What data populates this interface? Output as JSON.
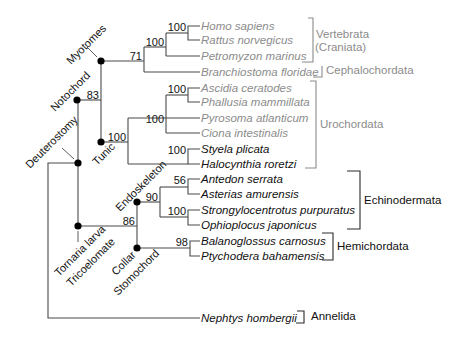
{
  "diagram": {
    "type": "phylogenetic-tree",
    "tips": [
      {
        "name": "Homo sapiens",
        "style": "gray"
      },
      {
        "name": "Rattus norvegicus",
        "style": "gray"
      },
      {
        "name": "Petromyzon marinus",
        "style": "gray"
      },
      {
        "name": "Branchiostoma floridae",
        "style": "gray"
      },
      {
        "name": "Ascidia ceratodes",
        "style": "gray"
      },
      {
        "name": "Phallusia mammillata",
        "style": "gray"
      },
      {
        "name": "Pyrosoma atlanticum",
        "style": "gray"
      },
      {
        "name": "Ciona intestinalis",
        "style": "gray"
      },
      {
        "name": "Styela plicata",
        "style": "black"
      },
      {
        "name": "Halocynthia roretzi",
        "style": "black"
      },
      {
        "name": "Antedon serrata",
        "style": "black"
      },
      {
        "name": "Asterias amurensis",
        "style": "black"
      },
      {
        "name": "Strongylocentrotus purpuratus",
        "style": "black"
      },
      {
        "name": "Ophioplocus japonicus",
        "style": "black"
      },
      {
        "name": "Balanoglossus carnosus",
        "style": "black"
      },
      {
        "name": "Ptychodera bahamensis",
        "style": "black"
      },
      {
        "name": "Nephtys hombergii",
        "style": "black"
      }
    ],
    "support": {
      "homo_rattus": "100",
      "vertebrata": "100",
      "chordata_71": "71",
      "notochord": "83",
      "ascidia_phallusia": "100",
      "urochordata_inner": "100",
      "urochordata": "100",
      "styela_halocynthia": "100",
      "antedon_asterias": "56",
      "echinodermata": "90",
      "strongylo_ophio": "100",
      "ambulacraria": "86",
      "hemichordata": "98"
    },
    "node_labels": {
      "myotomes": "Myotomes",
      "notochord": "Notochord",
      "deuterostomy": "Deuterostomy",
      "tunic": "Tunic",
      "endoskeleton": "Endoskeleton",
      "tornaria_larva": "Tornaria larva",
      "tricoelomate": "Tricoelomate",
      "collar": "Collar",
      "stomochord": "Stomochord"
    },
    "groups": [
      {
        "name": "Vertebrata",
        "style": "gray"
      },
      {
        "name": "(Craniata)",
        "style": "gray"
      },
      {
        "name": "Cephalochordata",
        "style": "gray"
      },
      {
        "name": "Urochordata",
        "style": "gray"
      },
      {
        "name": "Echinodermata",
        "style": "black"
      },
      {
        "name": "Hemichordata",
        "style": "black"
      },
      {
        "name": "Annelida",
        "style": "black"
      }
    ]
  }
}
